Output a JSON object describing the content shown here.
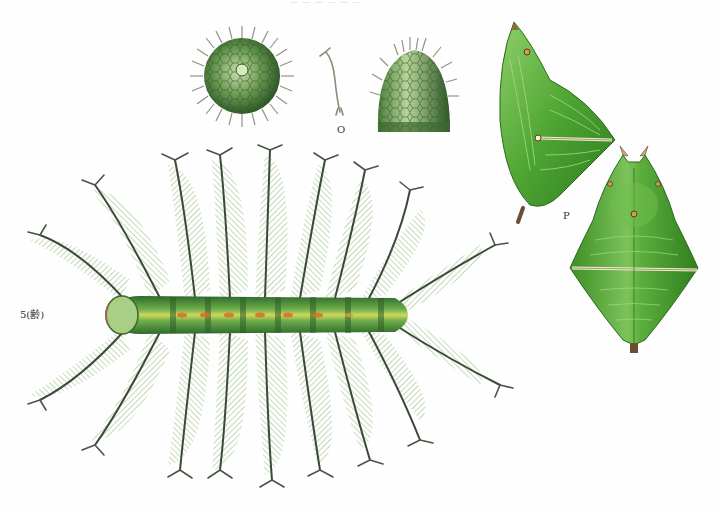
{
  "plate": {
    "header_text": "— — — — — —",
    "background": "#fefefe"
  },
  "labels": {
    "larva_stage": "5(齢)",
    "egg_group": "O",
    "pupa_group": "P"
  },
  "figures": [
    {
      "id": "egg-top-view",
      "description": "Egg viewed from above, spherical with radiating bristles",
      "center": [
        242,
        76
      ],
      "color": "#5f8f4a"
    },
    {
      "id": "egg-bristle-detail",
      "description": "Single bristle/seta of egg, magnified",
      "center": [
        330,
        80
      ],
      "color": "#8a8c78"
    },
    {
      "id": "egg-side-view",
      "description": "Egg viewed from side, dome shape with hexagonal sculpture and bristles",
      "center": [
        414,
        85
      ],
      "color": "#5a8a44"
    },
    {
      "id": "larva-dorsal",
      "description": "Fifth instar larva, dorsal view with long branched plumose spines",
      "center": [
        260,
        315
      ],
      "color": "#6aa455"
    },
    {
      "id": "pupa-lateral",
      "description": "Green chrysalis, lateral view",
      "center": [
        545,
        120
      ],
      "color": "#5aa83a"
    },
    {
      "id": "pupa-dorsal",
      "description": "Green chrysalis, dorsal view",
      "center": [
        634,
        260
      ],
      "color": "#4f9e33"
    }
  ],
  "colors": {
    "body_green": "#4f8f3a",
    "spine_dark": "#3b4a38",
    "plume_green": "#7fb06a",
    "stripe_yellow": "#cfd85a",
    "spot_orange": "#e06a2a",
    "pupa_green": "#56a83a",
    "pupa_dark": "#2f7a22",
    "pupa_band": "#f0ecc8"
  }
}
